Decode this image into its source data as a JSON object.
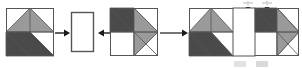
{
  "figure": {
    "caption": "",
    "background_color": "#ffffff",
    "outline_color": "#555555",
    "light_gray": "#9a9a9a",
    "dark_gray": "#4a4a4a",
    "white_fill": "#ffffff",
    "arrow_color": "#1a1a1a",
    "guide_color": "#bdbdbd"
  },
  "pieces": [
    {
      "id": "block-left",
      "name": "pieced-square-left",
      "label": "",
      "x": 6,
      "y": 8,
      "width": 48,
      "height": 48,
      "orientation": "original",
      "description": "Square block with light gray kite at top, dark gray band across lower-left diagonal, white background corners"
    },
    {
      "id": "spacer-1",
      "name": "white-spacer-rectangle",
      "label": "",
      "x": 71,
      "y": 12,
      "width": 23,
      "height": 40,
      "orientation": "vertical",
      "description": "Plain white rectangular sashing strip"
    },
    {
      "id": "block-right",
      "name": "pieced-square-right",
      "label": "",
      "x": 110,
      "y": 8,
      "width": 48,
      "height": 48,
      "orientation": "mirrored",
      "description": "Mirror image of left block, dark band across upper-left, light gray kite at right"
    }
  ],
  "result": {
    "id": "assembled-unit",
    "name": "assembled-block-unit",
    "x": 189,
    "y": 8,
    "width": 110,
    "height": 48,
    "segments": [
      {
        "name": "result-square-left",
        "orientation": "original",
        "width": 44
      },
      {
        "name": "result-spacer",
        "orientation": "spacer",
        "width": 22
      },
      {
        "name": "result-square-right",
        "orientation": "mirrored",
        "width": 44
      }
    ]
  },
  "arrows": [
    {
      "id": "arrow-1",
      "name": "arrow-right-to-spacer",
      "direction": "right",
      "x": 55,
      "y": 32,
      "length": 14
    },
    {
      "id": "arrow-2",
      "name": "arrow-left-to-spacer",
      "direction": "left",
      "x": 96,
      "y": 32,
      "length": 14
    },
    {
      "id": "arrow-3",
      "name": "arrow-to-result",
      "direction": "right",
      "x": 160,
      "y": 32,
      "length": 27
    }
  ],
  "dimension_marks": [
    {
      "id": "dim-left",
      "name": "seam-allowance-mark-left",
      "x": 246,
      "y": 2,
      "label": ""
    },
    {
      "id": "dim-right",
      "name": "seam-allowance-mark-right",
      "x": 265,
      "y": 2,
      "label": ""
    }
  ],
  "footnotes": [
    {
      "id": "swatch-1",
      "name": "fabric-swatch-light",
      "x": 236,
      "y": 60,
      "label": ""
    },
    {
      "id": "swatch-2",
      "name": "fabric-swatch-dark",
      "x": 258,
      "y": 60,
      "label": ""
    }
  ]
}
